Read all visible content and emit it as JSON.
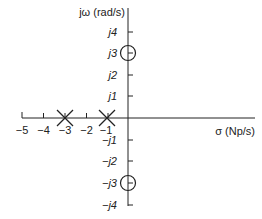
{
  "diagram": {
    "type": "s-plane pole-zero plot",
    "axes": {
      "vertical_label": "jω (rad/s)",
      "horizontal_label": "σ (Np/s)",
      "real_ticks": [
        "−5",
        "−4",
        "−3",
        "−2",
        "−1"
      ],
      "imag_ticks_positive": [
        "j4",
        "j3",
        "j2",
        "j1"
      ],
      "imag_ticks_negative": [
        "−j1",
        "−j2",
        "−j3",
        "−j4"
      ]
    },
    "poles": [
      {
        "label": "pole at −3",
        "sigma": -3,
        "omega": 0
      },
      {
        "label": "pole at −1",
        "sigma": -1,
        "omega": 0
      }
    ],
    "zeros": [
      {
        "label": "zero at j3",
        "sigma": 0,
        "omega": 3
      },
      {
        "label": "zero at −j3",
        "sigma": 0,
        "omega": -3
      }
    ],
    "colors": {
      "line": "#222222",
      "background": "#ffffff"
    }
  }
}
